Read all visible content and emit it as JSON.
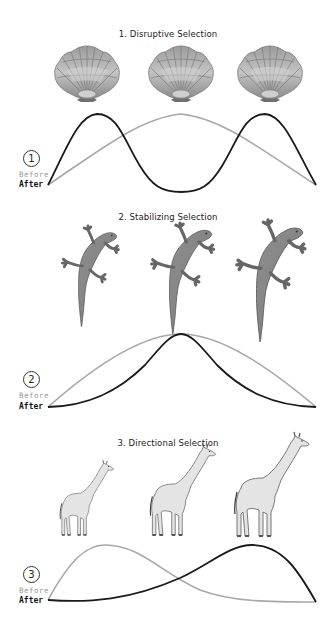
{
  "panels": [
    {
      "number": "1",
      "title": "1. Disruptive Selection",
      "organism": "scallop-shell",
      "organism_count": 3,
      "legend": {
        "before": "Before",
        "after": "After"
      },
      "before_curve": "single broad peak centered",
      "after_curve": "two peaks at extremes, trough in center"
    },
    {
      "number": "2",
      "title": "2. Stabilizing Selection",
      "organism": "lizard",
      "organism_count": 3,
      "legend": {
        "before": "Before",
        "after": "After"
      },
      "before_curve": "broad peak centered",
      "after_curve": "narrower, sharper peak centered"
    },
    {
      "number": "3",
      "title": "3. Directional Selection",
      "organism": "giraffe",
      "organism_count": 3,
      "legend": {
        "before": "Before",
        "after": "After"
      },
      "before_curve": "peak shifted left",
      "after_curve": "peak shifted right"
    }
  ],
  "colors": {
    "before_line": "#a8a8a8",
    "after_line": "#1a1a1a",
    "text": "#222222",
    "before_label": "#9a9a9a"
  }
}
